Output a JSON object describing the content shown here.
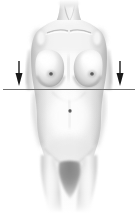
{
  "figure": {
    "title": "Female torso anterior view with bilateral downward arrows and horizontal reference line",
    "subject_label": "female-torso-anterior",
    "caption": "",
    "background_color": "#ffffff",
    "line_color": "#6e6e6e",
    "arrow_color": "#1a1a1a",
    "skin_light": "#fdfdfd",
    "skin_mid": "#dcdcdc",
    "skin_shadow": "#9a9a9a",
    "skin_deep_shadow": "#6b6b6b"
  },
  "canvas": {
    "width": 138,
    "height": 213
  },
  "annotations": {
    "reference_line": {
      "name": "horizontal-reference-line",
      "x1": 3,
      "x2": 135,
      "y": 89,
      "thickness": 1,
      "color": "#707070"
    },
    "arrows": [
      {
        "name": "left-down-arrow",
        "side": "left",
        "direction": "down",
        "x": 19,
        "y_top": 61,
        "y_tip": 86,
        "shaft_width": 1.4,
        "head_width": 7,
        "head_height": 13
      },
      {
        "name": "right-down-arrow",
        "side": "right",
        "direction": "down",
        "x": 120,
        "y_top": 61,
        "y_tip": 86,
        "shaft_width": 1.4,
        "head_width": 7,
        "head_height": 13
      }
    ]
  },
  "anatomy": {
    "landmarks": [
      {
        "name": "neck",
        "x": 69,
        "y": 12
      },
      {
        "name": "clavicle-left",
        "x": 52,
        "y": 33
      },
      {
        "name": "clavicle-right",
        "x": 87,
        "y": 33
      },
      {
        "name": "sternal-notch",
        "x": 69,
        "y": 31
      },
      {
        "name": "nipple-left",
        "x": 51,
        "y": 74
      },
      {
        "name": "nipple-right",
        "x": 92,
        "y": 74
      },
      {
        "name": "inframammary-fold",
        "x": 69,
        "y": 89
      },
      {
        "name": "umbilicus",
        "x": 70,
        "y": 111
      },
      {
        "name": "iliac-crest-left",
        "x": 36,
        "y": 133
      },
      {
        "name": "iliac-crest-right",
        "x": 105,
        "y": 133
      },
      {
        "name": "pubic-region",
        "x": 70,
        "y": 172
      }
    ]
  }
}
